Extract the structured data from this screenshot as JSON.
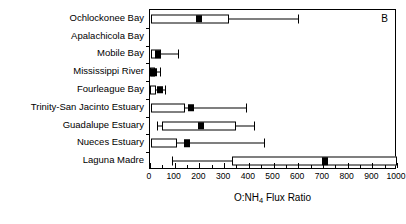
{
  "figure": {
    "panel_label": "B",
    "xlabel_prefix": "O:NH",
    "xlabel_sub": "4",
    "xlabel_suffix": " Flux Ratio"
  },
  "chart_data": {
    "type": "bar",
    "plot_style": "horizontal box-and-whisker",
    "title": "",
    "xlabel": "O:NH4 Flux Ratio",
    "ylabel": "",
    "xlim": [
      0,
      1000
    ],
    "xticks": [
      0,
      100,
      200,
      300,
      400,
      500,
      600,
      700,
      800,
      900,
      1000
    ],
    "xticklabels": [
      "0",
      "100",
      "200",
      "300",
      "400",
      "500",
      "600",
      "700",
      "800",
      "900",
      "1000"
    ],
    "minor_tick_interval": 50,
    "grid": false,
    "legend": null,
    "annotations": [
      "B"
    ],
    "categories": [
      "Ochlockonee Bay",
      "Apalachicola Bay",
      "Mobile Bay",
      "Mississippi River",
      "Fourleague  Bay",
      "Trinity-San Jacinto Estuary",
      "Guadalupe Estuary",
      "Nueces Estuary",
      "Laguna Madre"
    ],
    "boxes": [
      {
        "category": "Ochlockonee Bay",
        "has_data": true,
        "whisker_low": 5,
        "q1": 5,
        "median": 200,
        "q3": 320,
        "whisker_high": 600,
        "clipped_high": false
      },
      {
        "category": "Apalachicola Bay",
        "has_data": false,
        "whisker_low": null,
        "q1": null,
        "median": null,
        "q3": null,
        "whisker_high": null,
        "clipped_high": false
      },
      {
        "category": "Mobile Bay",
        "has_data": true,
        "whisker_low": 3,
        "q1": 3,
        "median": 33,
        "q3": 45,
        "whisker_high": 112,
        "clipped_high": false
      },
      {
        "category": "Mississippi River",
        "has_data": true,
        "whisker_low": 2,
        "q1": 2,
        "median": 18,
        "q3": 22,
        "whisker_high": 40,
        "clipped_high": false
      },
      {
        "category": "Fourleague  Bay",
        "has_data": true,
        "whisker_low": 2,
        "q1": 2,
        "median": 42,
        "q3": 25,
        "whisker_high": 62,
        "clipped_high": false
      },
      {
        "category": "Trinity-San Jacinto Estuary",
        "has_data": true,
        "whisker_low": 5,
        "q1": 5,
        "median": 165,
        "q3": 140,
        "whisker_high": 390,
        "clipped_high": false
      },
      {
        "category": "Guadalupe Estuary",
        "has_data": true,
        "whisker_low": 28,
        "q1": 48,
        "median": 205,
        "q3": 350,
        "whisker_high": 420,
        "clipped_high": false
      },
      {
        "category": "Nueces Estuary",
        "has_data": true,
        "whisker_low": 5,
        "q1": 5,
        "median": 150,
        "q3": 110,
        "whisker_high": 460,
        "clipped_high": false
      },
      {
        "category": "Laguna Madre",
        "has_data": true,
        "whisker_low": 90,
        "q1": 330,
        "median": 710,
        "q3": 1000,
        "whisker_high": 1000,
        "clipped_high": true
      }
    ]
  }
}
